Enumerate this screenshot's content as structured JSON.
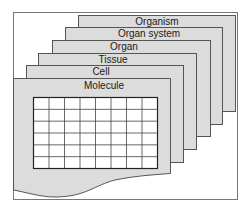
{
  "colors": {
    "sheet_fill": "#dcdcdc",
    "sheet_stroke": "#555555",
    "frame_stroke": "#777777",
    "grid_fill": "#ffffff",
    "grid_stroke": "#333333"
  },
  "layers": [
    {
      "label": "Organism",
      "x": 78,
      "y": 15,
      "w": 157,
      "h": 96
    },
    {
      "label": "Organ system",
      "x": 65,
      "y": 27,
      "w": 157,
      "h": 97
    },
    {
      "label": "Organ",
      "x": 52,
      "y": 40,
      "w": 158,
      "h": 96
    },
    {
      "label": "Tissue",
      "x": 38,
      "y": 53,
      "w": 158,
      "h": 96
    },
    {
      "label": "Cell",
      "x": 26,
      "y": 65,
      "w": 157,
      "h": 97
    },
    {
      "label": "Molecule",
      "x": 13,
      "y": 78,
      "w": 157,
      "h": 96
    }
  ],
  "grid": {
    "x": 33,
    "y": 97,
    "w": 124,
    "h": 71,
    "cols": 8,
    "rows": 6
  }
}
